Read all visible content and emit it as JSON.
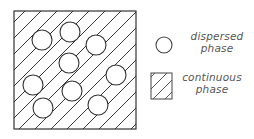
{
  "diagram": {
    "type": "emulsion-schematic",
    "box": {
      "x": 14,
      "y": 11,
      "w": 122,
      "h": 118
    },
    "particles": [
      {
        "cx": 42,
        "cy": 40,
        "r": 10
      },
      {
        "cx": 70,
        "cy": 32,
        "r": 10
      },
      {
        "cx": 96,
        "cy": 45,
        "r": 10
      },
      {
        "cx": 69,
        "cy": 63,
        "r": 10
      },
      {
        "cx": 33,
        "cy": 85,
        "r": 10
      },
      {
        "cx": 72,
        "cy": 91,
        "r": 10
      },
      {
        "cx": 116,
        "cy": 75,
        "r": 10
      },
      {
        "cx": 43,
        "cy": 108,
        "r": 10
      },
      {
        "cx": 98,
        "cy": 105,
        "r": 10
      }
    ],
    "colors": {
      "stroke": "#333333",
      "background": "#ffffff"
    }
  },
  "legend": {
    "items": [
      {
        "icon": "circle-icon",
        "line1": "dispersed",
        "line2": "phase"
      },
      {
        "icon": "hatched-square-icon",
        "line1": "continuous",
        "line2": "phase"
      }
    ]
  }
}
